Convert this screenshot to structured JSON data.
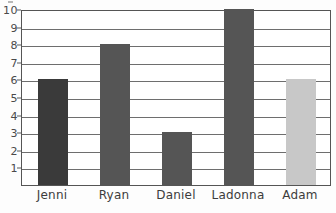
{
  "chart_data": {
    "type": "bar",
    "title": "",
    "subtitle": "",
    "xlabel": "",
    "ylabel": "",
    "categories": [
      "Jenni",
      "Ryan",
      "Daniel",
      "Ladonna",
      "Adam"
    ],
    "values": [
      6,
      8,
      3,
      10,
      6
    ],
    "bar_colors": [
      "#3a3a3a",
      "#555555",
      "#555555",
      "#555555",
      "#c8c8c8"
    ],
    "ylim": [
      0,
      10
    ],
    "y_ticks": [
      1,
      2,
      3,
      4,
      5,
      6,
      7,
      8,
      9,
      10
    ],
    "y_tick_labels": [
      "1",
      "2",
      "3",
      "4",
      "5",
      "6",
      "7",
      "8",
      "9",
      "10"
    ],
    "grid": true,
    "grid_axis": "y",
    "legend": false,
    "legend_position": "none",
    "annotations": []
  },
  "style": {
    "frame_color": "#555555",
    "grid_color": "#6e6e6e",
    "plot_background": "#ffffff",
    "page_background": "#fdfdfd",
    "tick_label_color": "#4a4a4a",
    "category_label_color": "#3c3c3c"
  }
}
